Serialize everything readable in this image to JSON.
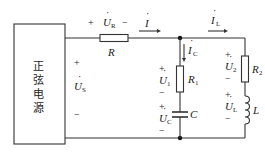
{
  "source": {
    "label_chars": [
      "正",
      "弦",
      "电",
      "源"
    ],
    "voltage": {
      "plus": "+",
      "symbol": "U",
      "dot": "·",
      "subscript": "S",
      "minus": "−"
    }
  },
  "series_resistor": {
    "name": "R",
    "voltage": {
      "plus": "+",
      "symbol": "U",
      "dot": "·",
      "subscript": "R",
      "minus": "−"
    }
  },
  "currents": {
    "total": {
      "symbol": "I",
      "dot": "·",
      "subscript": ""
    },
    "capacitor_branch": {
      "symbol": "I",
      "dot": "·",
      "subscript": "C"
    },
    "inductor_branch": {
      "symbol": "I",
      "dot": "·",
      "subscript": "L"
    }
  },
  "middle_branch": {
    "resistor": {
      "symbol": "R",
      "subscript": "1"
    },
    "resistor_voltage": {
      "plus": "+",
      "symbol": "U",
      "dot": "·",
      "subscript": "1",
      "minus": "−"
    },
    "capacitor": {
      "symbol": "C"
    },
    "capacitor_voltage": {
      "plus": "+",
      "symbol": "U",
      "dot": "·",
      "subscript": "C",
      "minus": "−"
    }
  },
  "right_branch": {
    "resistor": {
      "symbol": "R",
      "subscript": "2"
    },
    "resistor_voltage": {
      "plus": "+",
      "symbol": "U",
      "dot": "·",
      "subscript": "2",
      "minus": "−"
    },
    "inductor": {
      "symbol": "L"
    },
    "inductor_voltage": {
      "plus": "+",
      "symbol": "U",
      "dot": "·",
      "subscript": "L",
      "minus": "−"
    }
  }
}
